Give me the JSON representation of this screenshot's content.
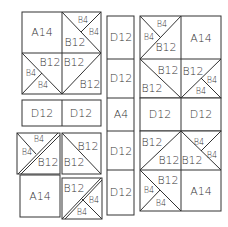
{
  "diagram": {
    "line_color": "#333333",
    "background": "#ffffff",
    "top_left_block": {
      "cells": [
        {
          "pos": "top-left",
          "labels": [
            "A14"
          ]
        },
        {
          "pos": "top-right",
          "labels": [
            "B4",
            "B4",
            "B12"
          ]
        },
        {
          "pos": "bottom-left",
          "labels": [
            "B12",
            "B4",
            "B4"
          ]
        },
        {
          "pos": "bottom-right",
          "labels": [
            "B12",
            "B12"
          ]
        }
      ]
    },
    "left_strip": {
      "cells": [
        {
          "label": "D12"
        },
        {
          "label": "D12"
        }
      ]
    },
    "bottom_left_block": {
      "cells": [
        {
          "pos": "top-left",
          "labels": [
            "B4",
            "B4",
            "B12"
          ]
        },
        {
          "pos": "top-right",
          "labels": [
            "B12",
            "B12"
          ]
        },
        {
          "pos": "bottom-left",
          "labels": [
            "A14"
          ]
        },
        {
          "pos": "bottom-right",
          "labels": [
            "B12",
            "B4",
            "B4"
          ]
        }
      ]
    },
    "center_column": {
      "cells": [
        {
          "label": "D12"
        },
        {
          "label": "D12"
        },
        {
          "label": "A4"
        },
        {
          "label": "D12"
        },
        {
          "label": "D12"
        }
      ]
    },
    "right_block": {
      "row1": [
        {
          "pos": "left",
          "labels": [
            "B4",
            "B4",
            "B12"
          ]
        },
        {
          "pos": "right",
          "labels": [
            "A14"
          ]
        }
      ],
      "row2": [
        {
          "pos": "left",
          "labels": [
            "B12",
            "B12"
          ]
        },
        {
          "pos": "right",
          "labels": [
            "B12",
            "B4",
            "B4"
          ]
        }
      ],
      "row3": [
        {
          "label": "D12"
        },
        {
          "label": "D12"
        }
      ],
      "row4": [
        {
          "pos": "left",
          "labels": [
            "B12",
            "B12"
          ]
        },
        {
          "pos": "right",
          "labels": [
            "B4",
            "B4",
            "B12"
          ]
        }
      ],
      "row5": [
        {
          "pos": "left",
          "labels": [
            "B12",
            "B4",
            "B4"
          ]
        },
        {
          "pos": "right",
          "labels": [
            "A14"
          ]
        }
      ]
    }
  }
}
